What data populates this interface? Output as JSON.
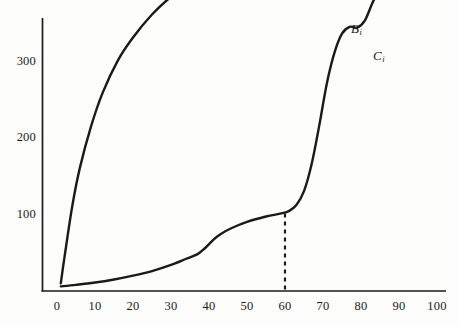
{
  "chart_data": {
    "type": "line",
    "title": "",
    "subtitle": "",
    "xlabel": "",
    "ylabel": "",
    "xlim": [
      0,
      100
    ],
    "ylim": [
      0,
      500
    ],
    "grid": false,
    "legend_position": "inline-curve-end",
    "x_ticks": [
      "0",
      "10",
      "20",
      "30",
      "40",
      "50",
      "60",
      "70",
      "80",
      "90",
      "100"
    ],
    "y_ticks": [
      "100",
      "200",
      "300",
      "400",
      "500"
    ],
    "axis_color": "#1a1a1a",
    "curve_color": "#1a1a1a",
    "series": [
      {
        "name": "B",
        "label": "B",
        "label_sub": "i",
        "style": "solid",
        "x": [
          1,
          2,
          4,
          6,
          9,
          12,
          16,
          20,
          25,
          30,
          35,
          40,
          45,
          50,
          55,
          60,
          65,
          70,
          74,
          78
        ],
        "y": [
          10,
          45,
          110,
          160,
          215,
          258,
          300,
          330,
          360,
          383,
          400,
          414,
          427,
          438,
          446,
          452,
          457,
          461,
          463,
          465
        ]
      },
      {
        "name": "C",
        "label": "C",
        "label_sub": "i",
        "style": "solid",
        "x": [
          1,
          5,
          10,
          15,
          20,
          25,
          30,
          34,
          37,
          39,
          41,
          43,
          46,
          50,
          55,
          59,
          61,
          63,
          65,
          67,
          69,
          71,
          73,
          75,
          77,
          79,
          81,
          83,
          85
        ],
        "y": [
          6,
          8,
          11,
          15,
          20,
          26,
          34,
          42,
          48,
          56,
          66,
          74,
          82,
          90,
          97,
          101,
          104,
          112,
          130,
          165,
          215,
          270,
          310,
          335,
          344,
          343,
          352,
          375,
          395
        ]
      }
    ],
    "annotations": [
      {
        "name": "dashed-drop-line",
        "type": "vertical-dashed",
        "x": 60,
        "y_from": 0,
        "y_to": 101,
        "dash": "4 4"
      }
    ]
  },
  "labels": {
    "curve_b": "B",
    "curve_b_sub": "i",
    "curve_c": "C",
    "curve_c_sub": "i"
  }
}
